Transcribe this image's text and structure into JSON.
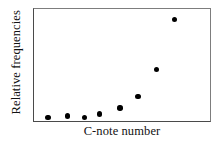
{
  "figure": {
    "background_color": "#ffffff",
    "frame_color": "#4a4a4a",
    "point_color": "#000000"
  },
  "axes": {
    "ylabel": "Relative frequencies",
    "xlabel": "C-note number"
  },
  "chart_data": {
    "type": "scatter",
    "title": "",
    "xlabel": "C-note number",
    "ylabel": "Relative frequencies",
    "grid": false,
    "legend": null,
    "xlim": [
      0,
      1
    ],
    "ylim": [
      0,
      1
    ],
    "xticks": [],
    "yticks": [],
    "x": [
      0.079,
      0.191,
      0.287,
      0.371,
      0.489,
      0.59,
      0.697,
      0.798
    ],
    "y": [
      0.03,
      0.044,
      0.03,
      0.062,
      0.115,
      0.221,
      0.458,
      0.907
    ],
    "points": [
      {
        "x": 0.079,
        "y": 0.03
      },
      {
        "x": 0.191,
        "y": 0.044
      },
      {
        "x": 0.287,
        "y": 0.03
      },
      {
        "x": 0.371,
        "y": 0.062
      },
      {
        "x": 0.489,
        "y": 0.115
      },
      {
        "x": 0.59,
        "y": 0.221
      },
      {
        "x": 0.697,
        "y": 0.458
      },
      {
        "x": 0.798,
        "y": 0.907
      }
    ],
    "marker": "circle",
    "marker_color": "#000000",
    "marker_size": 5
  }
}
